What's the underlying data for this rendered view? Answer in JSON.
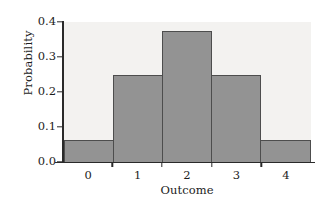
{
  "chart_data": {
    "type": "bar",
    "title": "",
    "subtitle": "",
    "xlabel": "Outcome",
    "ylabel": "Probability",
    "categories": [
      "0",
      "1",
      "2",
      "3",
      "4"
    ],
    "values": [
      0.0625,
      0.25,
      0.375,
      0.25,
      0.0625
    ],
    "series": [
      {
        "name": "Probability",
        "values": [
          0.0625,
          0.25,
          0.375,
          0.25,
          0.0625
        ]
      }
    ],
    "ylim": [
      0.0,
      0.4
    ],
    "xlim": [
      -0.5,
      4.5
    ],
    "ytick_labels": [
      "0.0",
      "0.1",
      "0.2",
      "0.3",
      "0.4"
    ],
    "ytick_values": [
      0.0,
      0.1,
      0.2,
      0.3,
      0.4
    ],
    "xtick_labels": [
      "0",
      "1",
      "2",
      "3",
      "4"
    ],
    "grid": false,
    "legend": false,
    "legend_position": "none",
    "annotations": [],
    "colors": {
      "bar_fill": "#939393",
      "bar_edge": "#4d4d4d",
      "plot_background": "#f3f2f0",
      "figure_background": "#ffffff",
      "axis": "#2a2a2a",
      "text": "#1c1c1c"
    }
  }
}
